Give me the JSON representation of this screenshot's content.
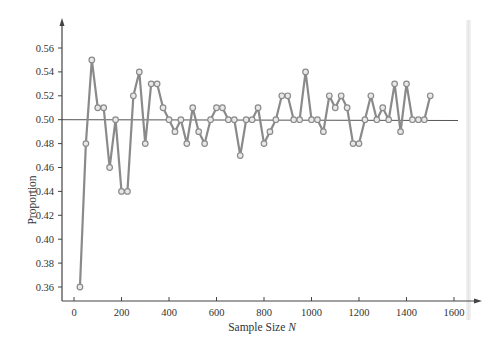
{
  "chart_data": {
    "type": "line",
    "title": "",
    "xlabel": "Sample Size N",
    "xlabel_main": "Sample Size ",
    "xlabel_var": "N",
    "ylabel": "Proportion",
    "xlim": [
      0,
      1650
    ],
    "ylim": [
      0.35,
      0.57
    ],
    "x_ticks": [
      0,
      200,
      400,
      600,
      800,
      1000,
      1200,
      1400,
      1600
    ],
    "y_ticks": [
      "0.36",
      "0.38",
      "0.40",
      "0.42",
      "0.44",
      "0.46",
      "0.48",
      "0.50",
      "0.52",
      "0.54",
      "0.56"
    ],
    "grid": false,
    "legend": null,
    "reference_line": {
      "y": 0.5,
      "label": ""
    },
    "series": [
      {
        "name": "Proportion",
        "color": "#8a8a8a",
        "marker": "open-circle",
        "x": [
          25,
          50,
          75,
          100,
          125,
          150,
          175,
          200,
          225,
          250,
          275,
          300,
          325,
          350,
          375,
          400,
          425,
          450,
          475,
          500,
          525,
          550,
          575,
          600,
          625,
          650,
          675,
          700,
          725,
          750,
          775,
          800,
          825,
          850,
          875,
          900,
          925,
          950,
          975,
          1000,
          1025,
          1050,
          1075,
          1100,
          1125,
          1150,
          1175,
          1200,
          1225,
          1250,
          1275,
          1300,
          1325,
          1350,
          1375,
          1400,
          1425,
          1450,
          1475,
          1500
        ],
        "values": [
          0.36,
          0.48,
          0.55,
          0.51,
          0.51,
          0.46,
          0.5,
          0.44,
          0.44,
          0.52,
          0.54,
          0.48,
          0.53,
          0.53,
          0.51,
          0.5,
          0.49,
          0.5,
          0.48,
          0.51,
          0.49,
          0.48,
          0.5,
          0.51,
          0.51,
          0.5,
          0.5,
          0.47,
          0.5,
          0.5,
          0.51,
          0.48,
          0.49,
          0.5,
          0.52,
          0.52,
          0.5,
          0.5,
          0.54,
          0.5,
          0.5,
          0.49,
          0.52,
          0.51,
          0.52,
          0.51,
          0.48,
          0.48,
          0.5,
          0.52,
          0.5,
          0.51,
          0.5,
          0.53,
          0.49,
          0.53,
          0.5,
          0.5,
          0.5,
          0.52
        ]
      }
    ]
  }
}
